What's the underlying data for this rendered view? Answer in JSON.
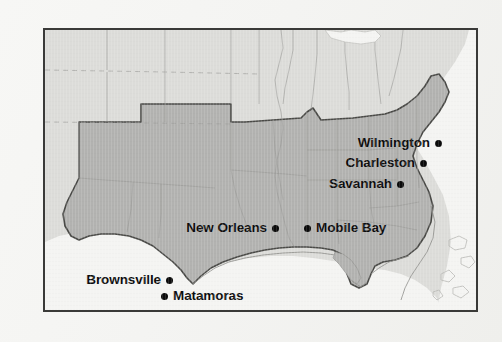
{
  "page": {
    "background_color": "#f6f6f4",
    "frame_color": "#3a3a38"
  },
  "map": {
    "title": "Confederate coastline and blockade-running ports",
    "colors": {
      "union_land": "#dcdcd9",
      "confederate_land": "#b2b2b0",
      "water": "#f4f4f2",
      "state_border": "#9a9a96",
      "confederacy_border": "#4a4a47",
      "coastline": "#8d8d89",
      "label_text": "#0d0d0d",
      "city_dot": "#0a0a0a"
    },
    "legend": {
      "confederate_shading_label": "Confederate States (dark shading)",
      "union_shading_label": "Union and territories (light shading)"
    },
    "cities": [
      {
        "name": "Wilmington",
        "dot_side": "right",
        "x": 435,
        "y": 143
      },
      {
        "name": "Charleston",
        "dot_side": "right",
        "x": 420,
        "y": 163
      },
      {
        "name": "Savannah",
        "dot_side": "right",
        "x": 397,
        "y": 184
      },
      {
        "name": "New Orleans",
        "dot_side": "right",
        "x": 272,
        "y": 228
      },
      {
        "name": "Mobile Bay",
        "dot_side": "left",
        "x": 304,
        "y": 228
      },
      {
        "name": "Brownsville",
        "dot_side": "right",
        "x": 166,
        "y": 280
      },
      {
        "name": "Matamoras",
        "dot_side": "left",
        "x": 161,
        "y": 296
      }
    ]
  }
}
